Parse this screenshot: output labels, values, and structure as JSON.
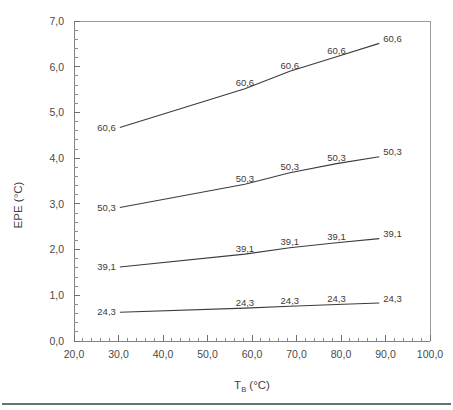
{
  "chart_data": {
    "type": "line",
    "title": "",
    "xlabel": "T_B (°C)",
    "xlabel_base": "T",
    "xlabel_sub": "B",
    "xlabel_unit": " (°C)",
    "ylabel": "EPE (°C)",
    "xlim": [
      20.0,
      100.0
    ],
    "ylim": [
      0.0,
      7.0
    ],
    "xticks": [
      20.0,
      30.0,
      40.0,
      50.0,
      60.0,
      70.0,
      80.0,
      90.0,
      100.0
    ],
    "xtick_labels": [
      "20,0",
      "30,0",
      "40,0",
      "50,0",
      "60,0",
      "70,0",
      "80,0",
      "90,0",
      "100,0"
    ],
    "yticks": [
      0.0,
      1.0,
      2.0,
      3.0,
      4.0,
      5.0,
      6.0,
      7.0
    ],
    "ytick_labels": [
      "0,0",
      "1,0",
      "2,0",
      "3,0",
      "4,0",
      "5,0",
      "6,0",
      "7,0"
    ],
    "x": [
      30.3,
      58.4,
      68.5,
      79.0,
      88.6
    ],
    "grid": false,
    "legend": "none",
    "decimal_separator": ",",
    "series": [
      {
        "name": "60,6",
        "label": "60,6",
        "values": [
          4.67,
          5.52,
          5.9,
          6.22,
          6.51
        ],
        "point_labels": [
          "60,6",
          "60,6",
          "60,6",
          "60,6",
          "60,6"
        ]
      },
      {
        "name": "50,3",
        "label": "50,3",
        "values": [
          2.92,
          3.43,
          3.68,
          3.88,
          4.03
        ],
        "point_labels": [
          "50,3",
          "50,3",
          "50,3",
          "50,3",
          "50,3"
        ]
      },
      {
        "name": "39,1",
        "label": "39,1",
        "values": [
          1.62,
          1.9,
          2.04,
          2.15,
          2.24
        ],
        "point_labels": [
          "39,1",
          "39,1",
          "39,1",
          "39,1",
          "39,1"
        ]
      },
      {
        "name": "24,3",
        "label": "24,3",
        "values": [
          0.63,
          0.72,
          0.76,
          0.8,
          0.83
        ],
        "point_labels": [
          "24,3",
          "24,3",
          "24,3",
          "24,3",
          "24,3"
        ]
      }
    ]
  },
  "colors": {
    "line": "#3c3c3c",
    "axis": "#808080",
    "text": "#3a3a3a",
    "background": "#ffffff"
  }
}
